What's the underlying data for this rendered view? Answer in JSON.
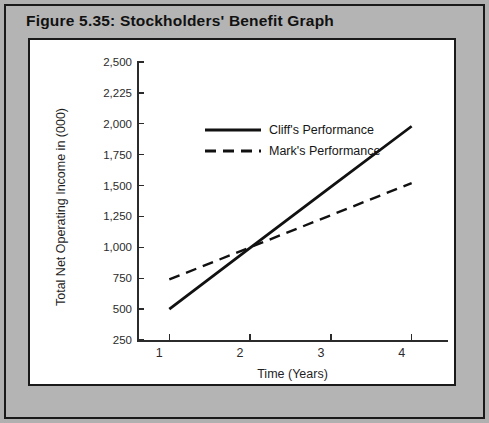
{
  "figure": {
    "title": "Figure 5.35: Stockholders' Benefit Graph"
  },
  "colors": {
    "page_background": "#b0b0b0",
    "frame_border": "#1a1a1a",
    "panel_background": "#ffffff",
    "axis": "#2b2b2b",
    "series_line": "#111111",
    "title_text": "#111111"
  },
  "chart_data": {
    "type": "line",
    "title": "Figure 5.35: Stockholders' Benefit Graph",
    "xlabel": "Time (Years)",
    "ylabel": "Total Net Operating Income in (000)",
    "x": [
      1,
      2,
      3,
      4
    ],
    "xticklabels": [
      "1",
      "2",
      "3",
      "4"
    ],
    "xlim": [
      0.6,
      4.45
    ],
    "yticks": [
      250,
      500,
      750,
      1000,
      1250,
      1500,
      1750,
      2000,
      2225,
      2500
    ],
    "yticklabels": [
      "250",
      "500",
      "750",
      "1,000",
      "1,250",
      "1,500",
      "1,750",
      "2,000",
      "2,225",
      "2,500"
    ],
    "ylim": [
      250,
      2500
    ],
    "grid": false,
    "legend_position": "upper-center-left",
    "series": [
      {
        "name": "Cliff's Performance",
        "style": "solid",
        "values": [
          500,
          995,
          1490,
          1980
        ]
      },
      {
        "name": "Mark's Performance",
        "style": "dashed",
        "values": [
          740,
          1000,
          1260,
          1520
        ]
      }
    ]
  },
  "legend": {
    "entries": [
      {
        "label": "Cliff's Performance",
        "style": "solid"
      },
      {
        "label": "Mark's Performance",
        "style": "dashed"
      }
    ]
  }
}
